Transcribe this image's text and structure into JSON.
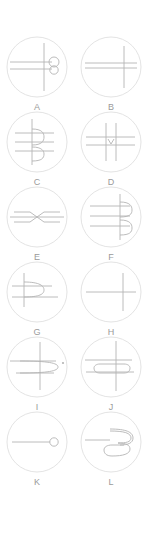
{
  "figure": {
    "type": "panel-grid",
    "background_color": "#ffffff",
    "width": 149,
    "height": 535,
    "columns": 2,
    "rows": 6,
    "disc_stroke_color": "#dcdcdc",
    "curve_stroke_color": "#b4b4b4",
    "label_color": "#9a9a9a",
    "panels": [
      {
        "label": "A",
        "column": 0,
        "row": 0,
        "description": "circle with two horizontal lines, one vertical line, and a figure-eight of two small loops at the right",
        "features": [
          "horizontal-line",
          "horizontal-line",
          "vertical-line",
          "small-loop",
          "small-loop"
        ]
      },
      {
        "label": "B",
        "column": 1,
        "row": 0,
        "description": "circle with two horizontal lines crossed by a single vertical line",
        "features": [
          "horizontal-line",
          "horizontal-line",
          "vertical-line"
        ]
      },
      {
        "label": "C",
        "column": 0,
        "row": 1,
        "description": "circle with vertical line, three horizontal lines and two rounded right-facing bumps",
        "features": [
          "vertical-line",
          "horizontal-line",
          "horizontal-line",
          "horizontal-line",
          "bump",
          "bump"
        ]
      },
      {
        "label": "D",
        "column": 1,
        "row": 1,
        "description": "circle with two vertical lines, two horizontal lines and a small v-shaped cusp at the centre",
        "features": [
          "vertical-line",
          "vertical-line",
          "horizontal-line",
          "horizontal-line",
          "cusp"
        ]
      },
      {
        "label": "E",
        "column": 0,
        "row": 2,
        "description": "circle with two horizontal lines meeting in a bowtie of two opposing arrow cusps",
        "features": [
          "horizontal-line",
          "horizontal-line",
          "arrow-cusp",
          "arrow-cusp"
        ]
      },
      {
        "label": "F",
        "column": 1,
        "row": 2,
        "description": "circle with vertical line, three horizontal lines and two rounded right-facing bumps",
        "features": [
          "vertical-line",
          "horizontal-line",
          "horizontal-line",
          "horizontal-line",
          "bump",
          "bump"
        ]
      },
      {
        "label": "G",
        "column": 0,
        "row": 3,
        "description": "circle with vertical line, two horizontal lines and one rounded right-facing bump",
        "features": [
          "vertical-line",
          "horizontal-line",
          "horizontal-line",
          "bump"
        ]
      },
      {
        "label": "H",
        "column": 1,
        "row": 3,
        "description": "circle with a single horizontal line and a single vertical line forming a cross",
        "features": [
          "horizontal-line",
          "vertical-line"
        ]
      },
      {
        "label": "I",
        "column": 0,
        "row": 4,
        "description": "circle with a cross and a large rounded loop opening to the left, plus a dot at the right rim",
        "features": [
          "horizontal-line",
          "vertical-line",
          "large-loop",
          "dot"
        ]
      },
      {
        "label": "J",
        "column": 1,
        "row": 4,
        "description": "circle with a cross and an elongated rounded stadium loop across the centre",
        "features": [
          "horizontal-line",
          "vertical-line",
          "stadium-loop"
        ]
      },
      {
        "label": "K",
        "column": 0,
        "row": 5,
        "description": "circle with a horizontal line terminating in a small open circle",
        "features": [
          "horizontal-line",
          "small-circle"
        ]
      },
      {
        "label": "L",
        "column": 1,
        "row": 5,
        "description": "circle with a horizontal line running into a serpentine double-folded loop",
        "features": [
          "horizontal-line",
          "serpentine-loop"
        ]
      }
    ]
  }
}
